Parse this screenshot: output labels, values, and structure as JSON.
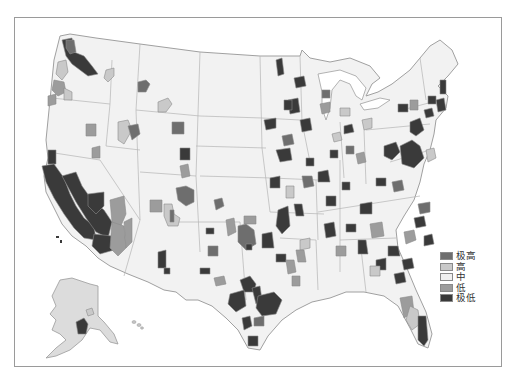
{
  "map": {
    "type": "choropleth",
    "region": "United States (contiguous, with Alaska and Hawaii inset)",
    "style": "grayscale",
    "colors": {
      "background": "#ffffff",
      "land": "#f2f2f2",
      "border": "#9a9a9a"
    }
  },
  "legend": {
    "items": [
      {
        "label": "极高",
        "color": "#6e6e6e"
      },
      {
        "label": "高",
        "color": "#c9c9c9"
      },
      {
        "label": "中",
        "color": "#f0f0f0"
      },
      {
        "label": "低",
        "color": "#9c9c9c"
      },
      {
        "label": "极低",
        "color": "#3a3a3a"
      }
    ]
  },
  "regions": [
    {
      "cls": 4,
      "d": "M62 40 L72 38 L74 52 L84 56 L92 66 L98 74 L88 76 L80 70 L72 64 L66 56 Z"
    },
    {
      "cls": 0,
      "d": "M66 40 L74 40 L76 52 L70 54 L66 48 Z"
    },
    {
      "cls": 1,
      "d": "M58 62 L66 60 L68 72 L62 80 L56 74 Z"
    },
    {
      "cls": 3,
      "d": "M54 80 L64 82 L66 92 L58 96 L52 90 Z"
    },
    {
      "cls": 1,
      "d": "M64 88 L72 92 L72 100 L64 100 Z"
    },
    {
      "cls": 3,
      "d": "M48 96 L56 94 L56 104 L48 106 Z"
    },
    {
      "cls": 0,
      "d": "M138 82 L146 80 L150 84 L146 92 L138 92 Z"
    },
    {
      "cls": 1,
      "d": "M106 70 L114 68 L114 76 L108 82 L104 78 Z"
    },
    {
      "cls": 1,
      "d": "M158 102 L168 98 L172 104 L166 112 L158 112 Z"
    },
    {
      "cls": 3,
      "d": "M86 124 L96 124 L96 136 L86 136 Z"
    },
    {
      "cls": 3,
      "d": "M92 148 L100 146 L100 158 L92 158 Z"
    },
    {
      "cls": 1,
      "d": "M118 122 L128 120 L132 130 L124 144 L118 140 Z"
    },
    {
      "cls": 0,
      "d": "M128 126 L138 124 L140 134 L132 140 Z"
    },
    {
      "cls": 0,
      "d": "M172 122 L184 122 L184 134 L172 134 Z"
    },
    {
      "cls": 4,
      "d": "M48 150 L56 150 L56 164 L48 164 Z"
    },
    {
      "cls": 4,
      "d": "M42 166 L54 164 L64 178 L70 194 L76 206 L84 218 L94 226 L96 240 L84 238 L74 228 L64 214 L54 198 L46 182 Z"
    },
    {
      "cls": 4,
      "d": "M62 176 L76 172 L82 186 L92 200 L104 210 L112 222 L108 238 L96 232 L86 218 L76 202 Z"
    },
    {
      "cls": 4,
      "d": "M88 194 L104 192 L104 206 L96 214 L88 206 Z"
    },
    {
      "cls": 4,
      "d": "M94 234 L112 236 L114 250 L100 254 L92 246 Z"
    },
    {
      "cls": 3,
      "d": "M110 200 L124 196 L126 214 L120 228 L112 222 Z"
    },
    {
      "cls": 3,
      "d": "M112 222 L124 226 L126 248 L118 256 L110 248 Z"
    },
    {
      "cls": 3,
      "d": "M124 222 L132 218 L132 242 L126 248 Z"
    },
    {
      "cls": 3,
      "d": "M150 200 L162 200 L162 212 L150 212 Z"
    },
    {
      "cls": 1,
      "d": "M164 204 L172 204 L174 214 L180 218 L178 226 L168 226 L164 216 Z"
    },
    {
      "cls": 0,
      "d": "M170 210 L174 210 L174 222 L170 222 Z"
    },
    {
      "cls": 4,
      "d": "M158 252 L166 250 L166 268 L158 268 Z"
    },
    {
      "cls": 4,
      "d": "M164 268 L170 268 L170 274 L164 274 Z"
    },
    {
      "cls": 3,
      "d": "M180 166 L188 164 L190 176 L182 178 Z"
    },
    {
      "cls": 4,
      "d": "M180 148 L190 148 L190 160 L180 160 Z"
    },
    {
      "cls": 0,
      "d": "M176 188 L186 186 L194 190 L194 202 L186 206 L178 200 Z"
    },
    {
      "cls": 0,
      "d": "M214 200 L222 198 L224 206 L216 210 Z"
    },
    {
      "cls": 4,
      "d": "M206 228 L214 228 L214 234 L206 234 Z"
    },
    {
      "cls": 0,
      "d": "M208 246 L218 246 L218 256 L208 256 Z"
    },
    {
      "cls": 4,
      "d": "M200 268 L210 268 L210 274 L200 274 Z"
    },
    {
      "cls": 3,
      "d": "M214 278 L224 276 L226 284 L216 286 Z"
    },
    {
      "cls": 3,
      "d": "M226 220 L234 218 L236 232 L228 236 Z"
    },
    {
      "cls": 3,
      "d": "M244 216 L256 216 L256 224 L244 224 Z"
    },
    {
      "cls": 0,
      "d": "M238 226 L246 224 L254 230 L256 244 L246 250 L238 242 Z"
    },
    {
      "cls": 4,
      "d": "M246 244 L252 244 L252 250 L246 250 Z"
    },
    {
      "cls": 4,
      "d": "M240 280 L250 276 L256 284 L254 292 L244 292 Z"
    },
    {
      "cls": 4,
      "d": "M252 288 L260 286 L262 300 L256 304 Z"
    },
    {
      "cls": 4,
      "d": "M230 294 L244 290 L246 306 L236 312 L228 304 Z"
    },
    {
      "cls": 4,
      "d": "M242 318 L250 316 L252 326 L244 330 Z"
    },
    {
      "cls": 4,
      "d": "M258 296 L274 292 L282 300 L276 314 L262 316 L256 308 Z"
    },
    {
      "cls": 4,
      "d": "M248 336 L258 336 L258 346 L248 346 Z"
    },
    {
      "cls": 0,
      "d": "M254 318 L264 316 L264 326 L254 326 Z"
    },
    {
      "cls": 4,
      "d": "M262 234 L272 232 L274 248 L262 248 Z"
    },
    {
      "cls": 4,
      "d": "M278 210 L288 206 L290 226 L282 234 L276 226 Z"
    },
    {
      "cls": 4,
      "d": "M270 178 L280 176 L280 188 L270 188 Z"
    },
    {
      "cls": 1,
      "d": "M286 186 L294 186 L294 198 L286 198 Z"
    },
    {
      "cls": 4,
      "d": "M276 254 L286 254 L286 262 L276 262 Z"
    },
    {
      "cls": 3,
      "d": "M286 260 L294 260 L296 272 L288 274 Z"
    },
    {
      "cls": 3,
      "d": "M292 276 L300 276 L300 286 L292 286 Z"
    },
    {
      "cls": 4,
      "d": "M294 204 L302 204 L304 216 L296 216 Z"
    },
    {
      "cls": 1,
      "d": "M300 240 L310 238 L310 248 L300 250 Z"
    },
    {
      "cls": 3,
      "d": "M296 250 L304 250 L306 262 L298 262 Z"
    },
    {
      "cls": 4,
      "d": "M306 158 L314 158 L314 166 L306 166 Z"
    },
    {
      "cls": 0,
      "d": "M302 176 L312 176 L314 186 L304 188 Z"
    },
    {
      "cls": 4,
      "d": "M318 172 L328 170 L330 182 L318 182 Z"
    },
    {
      "cls": 4,
      "d": "M326 196 L336 196 L336 206 L326 206 Z"
    },
    {
      "cls": 4,
      "d": "M324 224 L334 222 L336 236 L326 238 Z"
    },
    {
      "cls": 3,
      "d": "M336 246 L346 246 L346 256 L336 256 Z"
    },
    {
      "cls": 4,
      "d": "M346 224 L356 224 L356 232 L346 232 Z"
    },
    {
      "cls": 4,
      "d": "M360 204 L372 202 L372 214 L360 214 Z"
    },
    {
      "cls": 4,
      "d": "M358 240 L366 240 L368 254 L358 254 Z"
    },
    {
      "cls": 3,
      "d": "M370 224 L382 222 L384 236 L372 238 Z"
    },
    {
      "cls": 4,
      "d": "M376 260 L386 258 L386 270 L376 270 Z"
    },
    {
      "cls": 4,
      "d": "M388 246 L398 246 L400 256 L388 256 Z"
    },
    {
      "cls": 1,
      "d": "M370 266 L380 266 L380 276 L370 276 Z"
    },
    {
      "cls": 4,
      "d": "M394 274 L404 272 L406 282 L396 284 Z"
    },
    {
      "cls": 4,
      "d": "M402 260 L412 258 L414 268 L404 270 Z"
    },
    {
      "cls": 3,
      "d": "M404 232 L414 230 L416 240 L406 244 Z"
    },
    {
      "cls": 4,
      "d": "M414 218 L424 216 L426 226 L416 228 Z"
    },
    {
      "cls": 0,
      "d": "M418 204 L430 202 L430 212 L420 214 Z"
    },
    {
      "cls": 4,
      "d": "M424 236 L432 234 L434 244 L424 246 Z"
    },
    {
      "cls": 3,
      "d": "M400 298 L412 296 L414 312 L404 318 Z"
    },
    {
      "cls": 1,
      "d": "M410 306 L418 310 L420 324 L412 330 L406 320 Z"
    },
    {
      "cls": 4,
      "d": "M418 316 L426 316 L428 340 L424 346 L418 340 Z"
    },
    {
      "cls": 4,
      "d": "M288 100 L298 98 L300 112 L290 114 Z"
    },
    {
      "cls": 4,
      "d": "M294 78 L304 76 L306 86 L296 88 Z"
    },
    {
      "cls": 4,
      "d": "M276 60 L282 58 L284 74 L278 76 Z"
    },
    {
      "cls": 4,
      "d": "M284 100 L292 100 L292 110 L284 110 Z"
    },
    {
      "cls": 4,
      "d": "M264 120 L276 118 L276 128 L266 130 Z"
    },
    {
      "cls": 4,
      "d": "M276 150 L290 148 L292 160 L280 162 Z"
    },
    {
      "cls": 0,
      "d": "M282 136 L292 134 L294 144 L284 146 Z"
    },
    {
      "cls": 4,
      "d": "M300 120 L310 118 L312 130 L302 132 Z"
    },
    {
      "cls": 3,
      "d": "M320 104 L330 102 L330 112 L322 114 Z"
    },
    {
      "cls": 0,
      "d": "M322 90 L330 90 L330 98 L322 98 Z"
    },
    {
      "cls": 1,
      "d": "M340 108 L350 108 L350 116 L340 116 Z"
    },
    {
      "cls": 1,
      "d": "M332 134 L340 132 L342 140 L334 142 Z"
    },
    {
      "cls": 4,
      "d": "M344 126 L352 124 L354 132 L344 134 Z"
    },
    {
      "cls": 1,
      "d": "M362 120 L372 118 L372 128 L364 130 Z"
    },
    {
      "cls": 4,
      "d": "M384 146 L396 142 L400 152 L392 160 L384 156 Z"
    },
    {
      "cls": 4,
      "d": "M400 146 L412 140 L420 146 L424 158 L414 168 L402 164 Z"
    },
    {
      "cls": 4,
      "d": "M410 122 L420 118 L424 130 L416 136 L410 132 Z"
    },
    {
      "cls": 1,
      "d": "M426 150 L434 148 L436 158 L428 162 Z"
    },
    {
      "cls": 4,
      "d": "M424 110 L432 108 L434 116 L426 118 Z"
    },
    {
      "cls": 4,
      "d": "M436 100 L444 98 L446 110 L438 112 Z"
    },
    {
      "cls": 4,
      "d": "M428 96 L436 96 L436 104 L428 104 Z"
    },
    {
      "cls": 4,
      "d": "M440 80 L446 80 L446 94 L440 94 Z"
    },
    {
      "cls": 3,
      "d": "M410 100 L418 100 L418 110 L410 110 Z"
    },
    {
      "cls": 4,
      "d": "M398 104 L408 104 L408 112 L398 112 Z"
    },
    {
      "cls": 4,
      "d": "M376 178 L386 178 L386 186 L376 186 Z"
    },
    {
      "cls": 3,
      "d": "M356 154 L364 152 L366 162 L358 164 Z"
    },
    {
      "cls": 0,
      "d": "M392 182 L402 180 L404 190 L394 192 Z"
    },
    {
      "cls": 4,
      "d": "M342 182 L350 182 L350 190 L342 190 Z"
    },
    {
      "cls": 0,
      "d": "M346 146 L354 146 L354 154 L346 154 Z"
    },
    {
      "cls": 4,
      "d": "M330 150 L338 150 L338 158 L330 158 Z"
    }
  ],
  "inset_regions": [
    {
      "cls": 4,
      "d": "M76 322 L84 318 L88 324 L86 334 L78 334 Z"
    },
    {
      "cls": 1,
      "d": "M86 310 L92 308 L94 314 L88 316 Z"
    }
  ]
}
